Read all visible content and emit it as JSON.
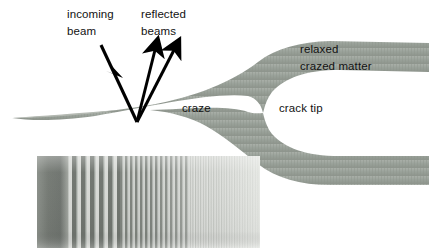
{
  "figure": {
    "kind": "schematic-diagram-with-micrograph",
    "width": 429,
    "height": 248,
    "background_color": "#ffffff"
  },
  "labels": {
    "incoming_beam": "incoming\nbeam",
    "incoming_beam_line1": "incoming",
    "incoming_beam_line2": "beam",
    "reflected_beams_line1": "reflected",
    "reflected_beams_line2": "beams",
    "relaxed_crazed_line1": "relaxed",
    "relaxed_crazed_line2": "crazed matter",
    "craze": "craze",
    "crack_tip": "crack tip"
  },
  "colors": {
    "craze_fill": "#9aa29a",
    "craze_fill_light": "#aeb4ad",
    "craze_fill_dark": "#888f88",
    "text": "#121212",
    "arrow": "#000000",
    "background": "#ffffff",
    "micrograph_dark": "#6f746f",
    "micrograph_light": "#e8eae7",
    "micrograph_mid": "#b9bdb8"
  },
  "craze_shape": {
    "description": "wedge tapering from sharp tip at left, widening to the right, splitting at the crack tip into two relaxed crazed-matter branches",
    "tip_x": 12,
    "tip_y": 118,
    "crack_tip_x": 263,
    "crack_tip_y": 113,
    "upper_branch_right_top": 43,
    "upper_branch_right_bottom": 72,
    "lower_branch_right_top": 156,
    "lower_branch_right_bottom": 185
  },
  "arrows": [
    {
      "name": "incoming-beam-arrow",
      "direction": "down-right",
      "x1": 101,
      "y1": 45,
      "x2": 137,
      "y2": 122,
      "head_at": "middle",
      "head_x": 120,
      "head_y": 73
    },
    {
      "name": "reflected-beam-arrow-1",
      "direction": "up",
      "x1": 137,
      "y1": 122,
      "x2": 155,
      "y2": 46
    },
    {
      "name": "reflected-beam-arrow-2",
      "direction": "up-right",
      "x1": 137,
      "y1": 122,
      "x2": 174,
      "y2": 46
    }
  ],
  "micrograph": {
    "name": "interference-fringe-micrograph",
    "x": 37,
    "y": 156,
    "width": 223,
    "height": 92,
    "regions": [
      {
        "name": "dark-gradient-left",
        "from_x": 37,
        "to_x": 67,
        "description": "uniform dark gray gradient, no fringes"
      },
      {
        "name": "wide-fringes",
        "from_x": 67,
        "to_x": 120,
        "description": "high-contrast vertical fringes, wide spacing"
      },
      {
        "name": "medium-fringes",
        "from_x": 120,
        "to_x": 190,
        "description": "vertical fringes, medium spacing, reduced contrast"
      },
      {
        "name": "fine-faint-fringes",
        "from_x": 190,
        "to_x": 260,
        "description": "very fine low-contrast fringes fading out"
      }
    ]
  }
}
